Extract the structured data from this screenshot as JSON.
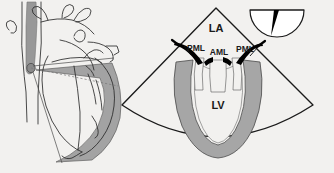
{
  "figure": {
    "background_color": "#f2f1ef",
    "panels": [
      {
        "id": "anatomy-panel",
        "name": "Anatomical heart and scan plane diagram",
        "description": "Line drawing of the heart, aorta and great vessels with the esophagus shaded gray and the ultrasound scan plane shown as a gray fan",
        "elements": [
          {
            "name": "aorta-outline",
            "label": ""
          },
          {
            "name": "esophagus-tube",
            "label": "",
            "color": "#8c8c8c"
          },
          {
            "name": "transducer-tip",
            "label": ""
          },
          {
            "name": "scan-plane-fan",
            "label": "",
            "color": "#9a9a9a"
          },
          {
            "name": "heart-outline",
            "label": ""
          }
        ]
      },
      {
        "id": "echo-sector-panel",
        "name": "Echocardiographic sector scan",
        "description": "Ultrasound sector image showing the left atrium, mitral valve leaflets and left ventricle",
        "labels": [
          {
            "id": "la",
            "text": "LA",
            "meaning": "Left atrium",
            "x": 216,
            "y": 29
          },
          {
            "id": "pml-left",
            "text": "PML",
            "meaning": "Posterior mitral leaflet",
            "x": 196,
            "y": 49
          },
          {
            "id": "aml",
            "text": "AML",
            "meaning": "Anterior mitral leaflet",
            "x": 219,
            "y": 53
          },
          {
            "id": "pml-right",
            "text": "PML",
            "meaning": "Posterior mitral leaflet",
            "x": 245,
            "y": 50
          },
          {
            "id": "lv",
            "text": "LV",
            "meaning": "Left ventricle",
            "x": 218,
            "y": 106
          }
        ],
        "colors": {
          "myocardium": "#a6a6a6",
          "leaflet": "#000000",
          "cavity": "#f2f1ef",
          "sector_outline": "#1a1a1a"
        },
        "sector": {
          "apex_x": 216,
          "apex_y": 8,
          "left_corner_x": 122,
          "left_corner_y": 105,
          "right_corner_x": 313,
          "right_corner_y": 105
        }
      },
      {
        "id": "transducer-orientation-inset",
        "name": "Transducer orientation icon",
        "description": "Semicircular icon indicating the imaging plane angle with a black wedge marker",
        "colors": {
          "wedge": "#000000",
          "body": "#ffffff",
          "outline": "#1a1a1a"
        }
      }
    ]
  }
}
